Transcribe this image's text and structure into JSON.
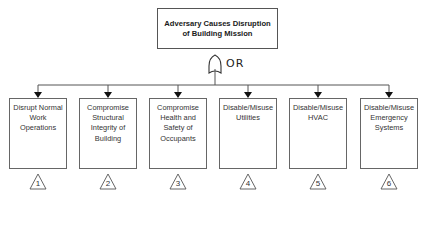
{
  "diagram": {
    "type": "fault-tree",
    "root": {
      "label": "Adversary Causes Disruption of Building Mission"
    },
    "gate": {
      "type": "OR",
      "label": "OR"
    },
    "children": [
      {
        "label": "Disrupt Normal Work Operations",
        "ref": "1"
      },
      {
        "label": "Compromise Structural Integrity of Building",
        "ref": "2"
      },
      {
        "label": "Compromise Health and Safety of Occupants",
        "ref": "3"
      },
      {
        "label": "Disable/Misuse Utilities",
        "ref": "4"
      },
      {
        "label": "Disable/Misuse HVAC",
        "ref": "5"
      },
      {
        "label": "Disable/Misuse Emergency Systems",
        "ref": "6"
      }
    ]
  },
  "colors": {
    "line": "#444444",
    "border": "#666666",
    "text": "#333333"
  }
}
